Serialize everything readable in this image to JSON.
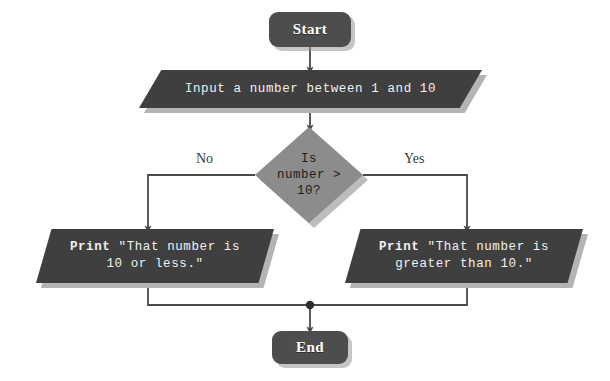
{
  "diagram": {
    "colors": {
      "background": "#ffffff",
      "terminator_fill": "#4d4d4d",
      "process_fill": "#3f3f3f",
      "decision_fill": "#8c8c8c",
      "shadow": "#b4b4b4",
      "edge": "#4a4a4a",
      "node_text_light": "#f2f2f2",
      "node_text_dark": "#1c1c1c"
    },
    "nodes": {
      "start": {
        "label": "Start",
        "shape": "terminator"
      },
      "input": {
        "label": "Input a number between 1 and 10",
        "shape": "parallelogram"
      },
      "decision": {
        "label": "Is\nnumber >\n10?",
        "shape": "diamond"
      },
      "print_less": {
        "keyword": "Print",
        "text": " \"That number is\n10 or less.\"",
        "shape": "parallelogram"
      },
      "print_greater": {
        "keyword": "Print",
        "text": " \"That number is\ngreater than 10.\"",
        "shape": "parallelogram"
      },
      "end": {
        "label": "End",
        "shape": "terminator"
      }
    },
    "edges": {
      "no_label": "No",
      "yes_label": "Yes"
    }
  }
}
